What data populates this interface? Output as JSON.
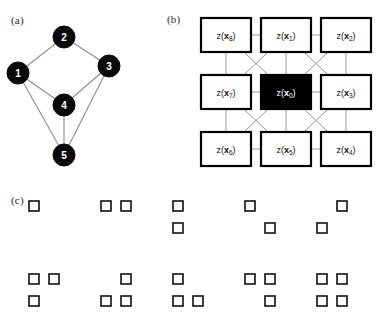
{
  "figure": {
    "panels": {
      "a": {
        "label": "(a)"
      },
      "b": {
        "label": "(b)"
      },
      "c": {
        "label": "(c)"
      }
    }
  },
  "panel_a": {
    "label": "(a)",
    "type": "undirected-graph",
    "nodes": [
      {
        "id": "1",
        "label": "1",
        "cx": 18,
        "cy": 65,
        "r": 11
      },
      {
        "id": "2",
        "label": "2",
        "cx": 64,
        "cy": 29,
        "r": 11
      },
      {
        "id": "3",
        "label": "3",
        "cx": 109,
        "cy": 58,
        "r": 11
      },
      {
        "id": "4",
        "label": "4",
        "cx": 64,
        "cy": 97,
        "r": 11
      },
      {
        "id": "5",
        "label": "5",
        "cx": 64,
        "cy": 147,
        "r": 11
      }
    ],
    "edges": [
      {
        "from": "1",
        "to": "2"
      },
      {
        "from": "2",
        "to": "3"
      },
      {
        "from": "1",
        "to": "4"
      },
      {
        "from": "3",
        "to": "4"
      },
      {
        "from": "1",
        "to": "5"
      },
      {
        "from": "4",
        "to": "5"
      },
      {
        "from": "3",
        "to": "5"
      }
    ],
    "node_fill": "#0a0a0a",
    "node_text_color": "#ffffff",
    "edge_color": "#8d8d8d"
  },
  "panel_b": {
    "label": "(b)",
    "type": "neighbourhood-grid",
    "center_fill": "#000000",
    "center_text_color": "#ffffff",
    "cell_fill": "#ffffff",
    "cell_stroke": "#000000",
    "link_color": "#9a9a9a",
    "cells": [
      {
        "row": 0,
        "col": 0,
        "prefix": "z(",
        "var": "x",
        "sub": "8",
        "suffix": ")",
        "center": false,
        "name": "cell-x8"
      },
      {
        "row": 0,
        "col": 1,
        "prefix": "z(",
        "var": "x",
        "sub": "1",
        "suffix": ")",
        "center": false,
        "name": "cell-x1"
      },
      {
        "row": 0,
        "col": 2,
        "prefix": "z(",
        "var": "x",
        "sub": "2",
        "suffix": ")",
        "center": false,
        "name": "cell-x2"
      },
      {
        "row": 1,
        "col": 0,
        "prefix": "z(",
        "var": "x",
        "sub": "7",
        "suffix": ")",
        "center": false,
        "name": "cell-x7"
      },
      {
        "row": 1,
        "col": 1,
        "prefix": "z(",
        "var": "x",
        "sub": "0",
        "suffix": ")",
        "center": true,
        "name": "cell-x0"
      },
      {
        "row": 1,
        "col": 2,
        "prefix": "z(",
        "var": "x",
        "sub": "3",
        "suffix": ")",
        "center": false,
        "name": "cell-x3"
      },
      {
        "row": 2,
        "col": 0,
        "prefix": "z(",
        "var": "x",
        "sub": "6",
        "suffix": ")",
        "center": false,
        "name": "cell-x6"
      },
      {
        "row": 2,
        "col": 1,
        "prefix": "z(",
        "var": "x",
        "sub": "5",
        "suffix": ")",
        "center": false,
        "name": "cell-x5"
      },
      {
        "row": 2,
        "col": 2,
        "prefix": "z(",
        "var": "x",
        "sub": "4",
        "suffix": ")",
        "center": false,
        "name": "cell-x4"
      }
    ]
  },
  "panel_c": {
    "label": "(c)",
    "type": "configuration-patterns",
    "square_fill": "#ffffff",
    "square_stroke": "#111111",
    "patterns": [
      {
        "index": 1,
        "row": 0,
        "col": 0,
        "cells": [
          "tl"
        ],
        "name": "pattern-single"
      },
      {
        "index": 2,
        "row": 0,
        "col": 1,
        "cells": [
          "tl",
          "tr"
        ],
        "name": "pattern-horizontal-pair"
      },
      {
        "index": 3,
        "row": 0,
        "col": 2,
        "cells": [
          "tl",
          "bl"
        ],
        "name": "pattern-vertical-pair"
      },
      {
        "index": 4,
        "row": 0,
        "col": 3,
        "cells": [
          "tl",
          "br"
        ],
        "name": "pattern-diagonal"
      },
      {
        "index": 5,
        "row": 0,
        "col": 4,
        "cells": [
          "tr",
          "bl"
        ],
        "name": "pattern-antidiagonal"
      },
      {
        "index": 6,
        "row": 1,
        "col": 0,
        "cells": [
          "tl",
          "tr",
          "bl"
        ],
        "name": "pattern-triple-no-br"
      },
      {
        "index": 7,
        "row": 1,
        "col": 1,
        "cells": [
          "tr",
          "bl",
          "br"
        ],
        "name": "pattern-triple-no-tl"
      },
      {
        "index": 8,
        "row": 1,
        "col": 2,
        "cells": [
          "tl",
          "bl",
          "br"
        ],
        "name": "pattern-triple-no-tr"
      },
      {
        "index": 9,
        "row": 1,
        "col": 3,
        "cells": [
          "tl",
          "tr",
          "br"
        ],
        "name": "pattern-triple-no-bl"
      },
      {
        "index": 10,
        "row": 1,
        "col": 4,
        "cells": [
          "tl",
          "tr",
          "bl",
          "br"
        ],
        "name": "pattern-quad"
      }
    ]
  }
}
